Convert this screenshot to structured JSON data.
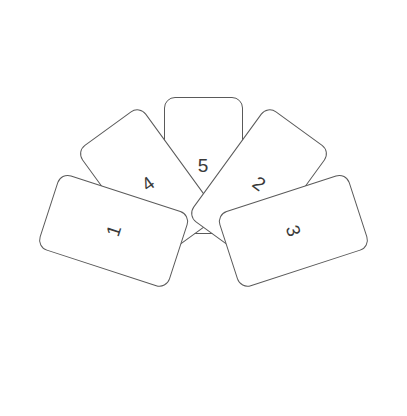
{
  "scene": {
    "name": "card-fan-diagram",
    "background_color": "#ffffff",
    "width": 407,
    "height": 416
  },
  "style": {
    "card_fill": "#ffffff",
    "card_stroke": "#5a5a5a",
    "card_stroke_width": 1,
    "card_corner_radius": 11,
    "label_color": "#3a3a3a",
    "label_font_size": 19
  },
  "fan": {
    "pivot_x": 203,
    "pivot_y": 260,
    "angle_step_degrees": 36,
    "card_width": 79,
    "card_height": 137
  },
  "cards": [
    {
      "id": "card-1",
      "label": "1",
      "rotation_degrees": -72,
      "center_x": 135,
      "center_y": 320
    },
    {
      "id": "card-2",
      "label": "2",
      "rotation_degrees": 36,
      "center_x": 308,
      "center_y": 180
    },
    {
      "id": "card-3",
      "label": "3",
      "rotation_degrees": 72,
      "center_x": 275,
      "center_y": 320
    },
    {
      "id": "card-4",
      "label": "4",
      "rotation_degrees": -36,
      "center_x": 98,
      "center_y": 180
    },
    {
      "id": "card-5",
      "label": "5",
      "rotation_degrees": 0,
      "center_x": 203,
      "center_y": 97
    }
  ],
  "render_order": [
    "card-5",
    "card-4",
    "card-2",
    "card-1",
    "card-3"
  ]
}
